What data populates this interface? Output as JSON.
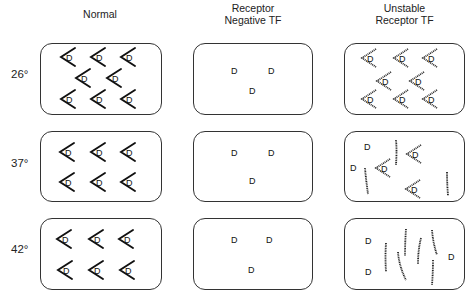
{
  "figure": {
    "columns": [
      {
        "id": "normal",
        "title_lines": [
          "Normal"
        ]
      },
      {
        "id": "negative",
        "title_lines": [
          "Receptor",
          "Negative TF"
        ]
      },
      {
        "id": "unstable",
        "title_lines": [
          "Unstable",
          "Receptor  TF"
        ]
      }
    ],
    "rows": [
      {
        "id": "t26",
        "label": "26°"
      },
      {
        "id": "t37",
        "label": "37°"
      },
      {
        "id": "t42",
        "label": "42°"
      }
    ],
    "legend_glyphs": {
      "receptor_bound": "chevron '<' with ligand 'D' inside",
      "free_ligand": "D",
      "denatured_receptor": "dotted strand"
    },
    "ligand_symbol": "D",
    "panels": {
      "normal": {
        "t26": {
          "bound_receptors": 8
        },
        "t37": {
          "bound_receptors": 6
        },
        "t42": {
          "bound_receptors": 6
        }
      },
      "negative": {
        "t26": {
          "free_ligand": 3
        },
        "t37": {
          "free_ligand": 3
        },
        "t42": {
          "free_ligand": 3
        }
      },
      "unstable": {
        "t26": {
          "bound_receptors": 8
        },
        "t37": {
          "bound_receptors": 3,
          "free_ligand": 2,
          "denatured_strands": 3
        },
        "t42": {
          "bound_receptors": 0,
          "free_ligand": 3,
          "denatured_strands": 7
        }
      }
    }
  }
}
